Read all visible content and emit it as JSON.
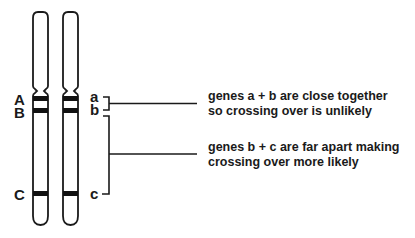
{
  "diagram": {
    "type": "genetic-linkage-chromosome-diagram",
    "colors": {
      "ink": "#1a1a1a",
      "background": "#ffffff"
    },
    "chromosomes": [
      {
        "id": "chromosome-1",
        "alleles": [
          "A",
          "B",
          "C"
        ]
      },
      {
        "id": "chromosome-2",
        "alleles": [
          "a",
          "b",
          "c"
        ]
      }
    ],
    "left_labels": {
      "A": "A",
      "B": "B",
      "C": "C"
    },
    "right_labels": {
      "a": "a",
      "b": "b",
      "c": "c"
    },
    "annotations": [
      {
        "target": "a-b",
        "line1": "genes a + b are close together",
        "line2": "so crossing over is unlikely"
      },
      {
        "target": "b-c",
        "line1": "genes b + c are far apart making",
        "line2": "crossing over more likely"
      }
    ]
  }
}
